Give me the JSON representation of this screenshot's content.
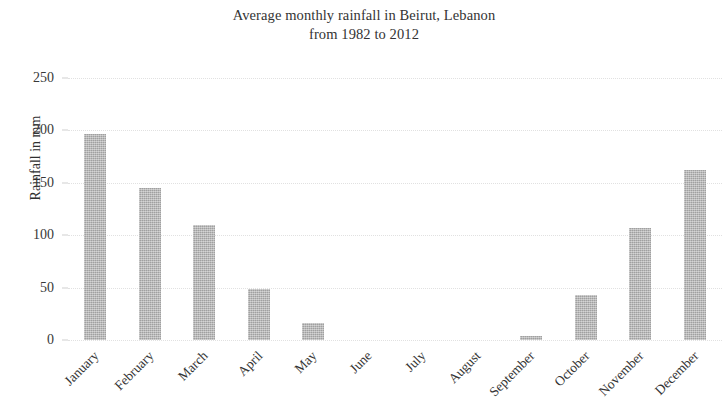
{
  "chart_data": {
    "type": "bar",
    "title": "Average monthly rainfall in Beirut, Lebanon from 1982 to 2012",
    "title_lines": [
      "Average monthly rainfall in Beirut, Lebanon",
      "from 1982 to 2012"
    ],
    "xlabel": "",
    "ylabel": "Rainfall in mm",
    "categories": [
      "January",
      "February",
      "March",
      "April",
      "May",
      "June",
      "July",
      "August",
      "September",
      "October",
      "November",
      "December"
    ],
    "values": [
      197,
      145,
      110,
      49,
      16,
      0,
      0,
      0,
      4,
      43,
      107,
      162
    ],
    "ylim": [
      0,
      250
    ],
    "ytick_labels": [
      "0",
      "50",
      "100",
      "150",
      "200",
      "250"
    ],
    "ytick_values": [
      0,
      50,
      100,
      150,
      200,
      250
    ],
    "grid": "horizontal-dotted",
    "legend": null,
    "bar_color": "#ababab",
    "text_color": "#333333",
    "gridline_color": "#dcdcdc",
    "background": "#ffffff"
  }
}
